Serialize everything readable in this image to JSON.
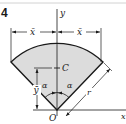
{
  "figure": {
    "number": "4",
    "labels": {
      "y_axis": "y",
      "x_axis": "x",
      "x_bar_left": "x̄",
      "x_bar_right": "x̄",
      "y_bar": "ȳ",
      "centroid": "C",
      "origin": "O",
      "alpha_left": "α",
      "alpha_right": "α",
      "radius": "r"
    },
    "colors": {
      "fill": "#dcdcdc",
      "stroke": "#1a1a1a",
      "top_rule": "#cfcfcf"
    }
  }
}
